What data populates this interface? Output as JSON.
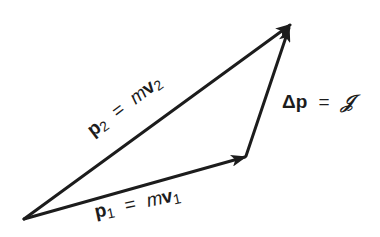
{
  "diagram": {
    "type": "vector-triangle",
    "vertices": {
      "origin": [
        24,
        219
      ],
      "p1_tip": [
        246,
        156
      ],
      "p2_tip": [
        290,
        25
      ]
    },
    "colors": {
      "line": "#1c1c1c",
      "background": "#ffffff"
    },
    "vectors": [
      {
        "id": "p2",
        "from": "origin",
        "to": "p2_tip",
        "symbol": "p",
        "subscript": "2",
        "equals": "=",
        "rhs_m": "m",
        "rhs_v": "v",
        "rhs_subscript": "2"
      },
      {
        "id": "p1",
        "from": "origin",
        "to": "p1_tip",
        "symbol": "p",
        "subscript": "1",
        "equals": "=",
        "rhs_m": "m",
        "rhs_v": "v",
        "rhs_subscript": "1"
      },
      {
        "id": "delta_p",
        "from": "p1_tip",
        "to": "p2_tip",
        "delta": "Δ",
        "symbol": "p",
        "equals": "=",
        "rhs": "𝒥"
      }
    ]
  }
}
